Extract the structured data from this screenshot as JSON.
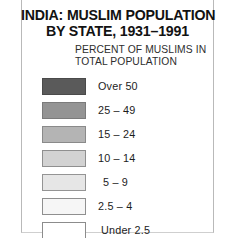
{
  "map_legend": {
    "title_lines": [
      "INDIA: MUSLIM POPULATION",
      "BY STATE, 1931–1991"
    ],
    "subtitle_lines": [
      "PERCENT OF MUSLIMS IN",
      "TOTAL POPULATION"
    ],
    "classes": [
      {
        "label": "Over 50",
        "color": "#5a5a5a",
        "border": "#4a4a4a"
      },
      {
        "label": "25 – 49",
        "color": "#949494",
        "border": "#7b7b7b"
      },
      {
        "label": "15 – 24",
        "color": "#b4b4b4",
        "border": "#8a8a8a"
      },
      {
        "label": "10 – 14",
        "color": "#d2d2d2",
        "border": "#8f8f8f"
      },
      {
        "label": "5 – 9",
        "color": "#e6e6e6",
        "border": "#949494"
      },
      {
        "label": "2.5 – 4",
        "color": "#f6f6f6",
        "border": "#8f8f8f"
      },
      {
        "label": "Under 2.5",
        "color": "#ffffff",
        "border": "#8c8c8c"
      }
    ]
  }
}
